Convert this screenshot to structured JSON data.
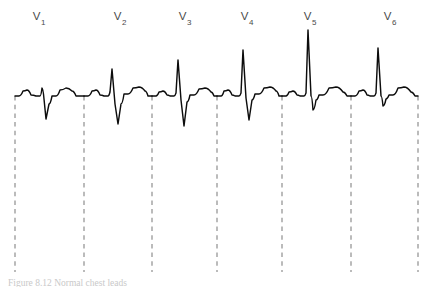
{
  "figure": {
    "caption": "Figure 8.12 Normal chest leads",
    "background_color": "#ffffff",
    "trace_color": "#0d0d0d",
    "divider_color": "#8a8a8a",
    "label_color": "#4a4a4a"
  },
  "labels": [
    {
      "name": "V",
      "subscript": "1",
      "x": 39,
      "y": 10
    },
    {
      "name": "V",
      "subscript": "2",
      "x": 120,
      "y": 10
    },
    {
      "name": "V",
      "subscript": "3",
      "x": 185,
      "y": 10
    },
    {
      "name": "V",
      "subscript": "4",
      "x": 247,
      "y": 10
    },
    {
      "name": "V",
      "subscript": "5",
      "x": 310,
      "y": 10
    },
    {
      "name": "V",
      "subscript": "6",
      "x": 390,
      "y": 10
    }
  ],
  "dividers": {
    "x_positions": [
      15,
      84,
      152,
      217,
      282,
      351,
      418
    ],
    "y_top": 96,
    "y_bottom": 272
  },
  "chart_data": {
    "type": "line",
    "title": "Normal chest leads",
    "xlabel": "",
    "ylabel": "",
    "grid": false,
    "legend": "none",
    "baseline_y": 96,
    "x_start": 15,
    "x_end": 418,
    "xlim": [
      15,
      418
    ],
    "ylim_pixels": [
      28,
      122
    ],
    "series_name": "ecg-trace",
    "leads": [
      {
        "label": "V1",
        "x_start": 15,
        "x_end": 84,
        "r_peak_y": 85,
        "s_trough_y": 119,
        "description": "small R wave, deep S wave",
        "points": [
          [
            15,
            96
          ],
          [
            19,
            96
          ],
          [
            23,
            91
          ],
          [
            27,
            90
          ],
          [
            31,
            95
          ],
          [
            36,
            96
          ],
          [
            40,
            96
          ],
          [
            42,
            88
          ],
          [
            44,
            99
          ],
          [
            46,
            119
          ],
          [
            49,
            104
          ],
          [
            52,
            96
          ],
          [
            56,
            96
          ],
          [
            60,
            90
          ],
          [
            66,
            88
          ],
          [
            72,
            91
          ],
          [
            76,
            96
          ],
          [
            80,
            96
          ],
          [
            84,
            96
          ]
        ]
      },
      {
        "label": "V2",
        "x_start": 84,
        "x_end": 152,
        "r_peak_y": 70,
        "s_trough_y": 124,
        "description": "taller R wave, deeper S wave",
        "points": [
          [
            84,
            96
          ],
          [
            88,
            96
          ],
          [
            92,
            91
          ],
          [
            96,
            90
          ],
          [
            100,
            95
          ],
          [
            104,
            96
          ],
          [
            108,
            96
          ],
          [
            110,
            92
          ],
          [
            112,
            69
          ],
          [
            115,
            104
          ],
          [
            118,
            124
          ],
          [
            121,
            104
          ],
          [
            124,
            94
          ],
          [
            128,
            94
          ],
          [
            133,
            88
          ],
          [
            139,
            87
          ],
          [
            145,
            91
          ],
          [
            148,
            96
          ],
          [
            152,
            96
          ]
        ]
      },
      {
        "label": "V3",
        "x_start": 152,
        "x_end": 217,
        "r_peak_y": 60,
        "s_trough_y": 126,
        "description": "R wave progression, deep S wave",
        "points": [
          [
            152,
            96
          ],
          [
            156,
            96
          ],
          [
            159,
            92
          ],
          [
            163,
            91
          ],
          [
            167,
            95
          ],
          [
            170,
            96
          ],
          [
            174,
            96
          ],
          [
            176,
            93
          ],
          [
            178,
            60
          ],
          [
            181,
            100
          ],
          [
            184,
            126
          ],
          [
            187,
            102
          ],
          [
            190,
            95
          ],
          [
            194,
            95
          ],
          [
            199,
            89
          ],
          [
            205,
            88
          ],
          [
            211,
            92
          ],
          [
            214,
            96
          ],
          [
            217,
            96
          ]
        ]
      },
      {
        "label": "V4",
        "x_start": 217,
        "x_end": 282,
        "r_peak_y": 50,
        "s_trough_y": 120,
        "description": "tall R wave, moderate S wave",
        "points": [
          [
            217,
            96
          ],
          [
            221,
            96
          ],
          [
            224,
            91
          ],
          [
            228,
            90
          ],
          [
            232,
            95
          ],
          [
            235,
            96
          ],
          [
            239,
            96
          ],
          [
            241,
            93
          ],
          [
            243,
            50
          ],
          [
            246,
            98
          ],
          [
            249,
            120
          ],
          [
            252,
            100
          ],
          [
            255,
            94
          ],
          [
            259,
            94
          ],
          [
            264,
            88
          ],
          [
            270,
            87
          ],
          [
            276,
            91
          ],
          [
            279,
            96
          ],
          [
            282,
            96
          ]
        ]
      },
      {
        "label": "V5",
        "x_start": 282,
        "x_end": 351,
        "r_peak_y": 30,
        "s_trough_y": 110,
        "description": "tallest R wave, small S wave",
        "points": [
          [
            282,
            96
          ],
          [
            286,
            96
          ],
          [
            289,
            92
          ],
          [
            293,
            91
          ],
          [
            297,
            95
          ],
          [
            300,
            96
          ],
          [
            304,
            96
          ],
          [
            306,
            93
          ],
          [
            308,
            30
          ],
          [
            311,
            96
          ],
          [
            313,
            110
          ],
          [
            316,
            100
          ],
          [
            319,
            95
          ],
          [
            323,
            95
          ],
          [
            329,
            88
          ],
          [
            336,
            87
          ],
          [
            343,
            92
          ],
          [
            347,
            96
          ],
          [
            351,
            96
          ]
        ]
      },
      {
        "label": "V6",
        "x_start": 351,
        "x_end": 418,
        "r_peak_y": 48,
        "s_trough_y": 106,
        "description": "tall R wave, minimal S wave",
        "points": [
          [
            351,
            96
          ],
          [
            355,
            96
          ],
          [
            359,
            91
          ],
          [
            363,
            90
          ],
          [
            367,
            95
          ],
          [
            370,
            96
          ],
          [
            374,
            96
          ],
          [
            376,
            93
          ],
          [
            378,
            48
          ],
          [
            381,
            96
          ],
          [
            383,
            106
          ],
          [
            386,
            99
          ],
          [
            389,
            95
          ],
          [
            393,
            95
          ],
          [
            398,
            88
          ],
          [
            404,
            87
          ],
          [
            411,
            92
          ],
          [
            415,
            96
          ],
          [
            418,
            96
          ]
        ]
      }
    ]
  }
}
